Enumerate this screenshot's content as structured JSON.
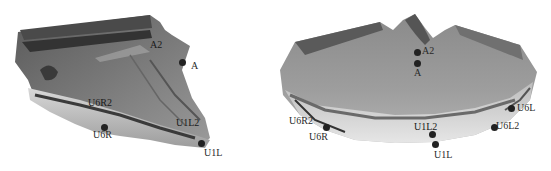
{
  "figure": {
    "panels": [
      {
        "id": "left",
        "view": "lateral",
        "landmarks": [
          {
            "label": "A2",
            "x": 155,
            "y": 44
          },
          {
            "label": "A",
            "x": 191,
            "y": 63
          },
          {
            "label": "U6R2",
            "x": 88,
            "y": 101
          },
          {
            "label": "U1L2",
            "x": 176,
            "y": 119
          },
          {
            "label": "U6R",
            "x": 93,
            "y": 134
          },
          {
            "label": "U1L",
            "x": 203,
            "y": 149
          }
        ]
      },
      {
        "id": "right",
        "view": "frontal",
        "landmarks": [
          {
            "label": "A2",
            "x": 425,
            "y": 48
          },
          {
            "label": "A",
            "x": 414,
            "y": 70
          },
          {
            "label": "U6L",
            "x": 517,
            "y": 104
          },
          {
            "label": "U6R2",
            "x": 289,
            "y": 116
          },
          {
            "label": "U1L2",
            "x": 414,
            "y": 122
          },
          {
            "label": "U6L2",
            "x": 496,
            "y": 121
          },
          {
            "label": "U6R",
            "x": 309,
            "y": 133
          },
          {
            "label": "U1L",
            "x": 434,
            "y": 150
          }
        ]
      }
    ],
    "colors": {
      "model_dark": "#3a3a3a",
      "model_mid": "#808080",
      "model_light": "#c8c8c8",
      "dot": "#222222",
      "label": "#2a2a2a"
    }
  }
}
